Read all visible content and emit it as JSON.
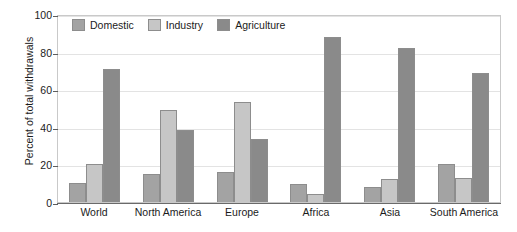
{
  "chart_data": {
    "type": "bar",
    "title": "",
    "xlabel": "",
    "ylabel": "Percent of total withdrawals",
    "ylim": [
      0,
      100
    ],
    "yticks": [
      0,
      20,
      40,
      60,
      80,
      100
    ],
    "grid": true,
    "legend_position": "top-left-inside",
    "categories": [
      "World",
      "North America",
      "Europe",
      "Africa",
      "Asia",
      "South America"
    ],
    "series": [
      {
        "name": "Domestic",
        "color": "#a3a3a3",
        "values": [
          10,
          15,
          16,
          9.5,
          8,
          20
        ]
      },
      {
        "name": "Industry",
        "color": "#c6c6c6",
        "values": [
          20,
          49,
          53,
          4.5,
          12.5,
          13
        ]
      },
      {
        "name": "Agriculture",
        "color": "#8a8a8a",
        "values": [
          70.5,
          38.5,
          33.5,
          88,
          82,
          68.5
        ]
      }
    ]
  }
}
